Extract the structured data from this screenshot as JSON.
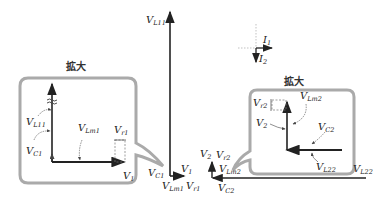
{
  "diagram": {
    "type": "phasor-diagram",
    "magnify_label": "拡大",
    "left_main": {
      "labels": {
        "VL11": {
          "base": "V",
          "sub": "L11"
        },
        "VC1": {
          "base": "V",
          "sub": "C1"
        },
        "V1": {
          "base": "V",
          "sub": "1"
        },
        "VLm1": {
          "base": "V",
          "sub": "Lm1"
        },
        "Vr1": {
          "base": "V",
          "sub": "r1"
        }
      }
    },
    "left_zoom": {
      "title": "拡大",
      "labels": {
        "VL11": {
          "base": "V",
          "sub": "L11"
        },
        "VC1": {
          "base": "V",
          "sub": "C1"
        },
        "VLm1": {
          "base": "V",
          "sub": "Lm1"
        },
        "Vr1": {
          "base": "V",
          "sub": "r1"
        },
        "V1": {
          "base": "V",
          "sub": "1"
        }
      }
    },
    "currents": {
      "I1": {
        "base": "I",
        "sub": "1"
      },
      "I2": {
        "base": "I",
        "sub": "2"
      }
    },
    "right_main": {
      "labels": {
        "V2": {
          "base": "V",
          "sub": "2"
        },
        "Vr2": {
          "base": "V",
          "sub": "r2"
        },
        "VLm2": {
          "base": "V",
          "sub": "Lm2"
        },
        "VC2": {
          "base": "V",
          "sub": "C2"
        },
        "VL22": {
          "base": "V",
          "sub": "L22"
        }
      }
    },
    "right_zoom": {
      "title": "拡大",
      "labels": {
        "Vr2": {
          "base": "V",
          "sub": "r2"
        },
        "VLm2": {
          "base": "V",
          "sub": "Lm2"
        },
        "V2": {
          "base": "V",
          "sub": "2"
        },
        "VC2": {
          "base": "V",
          "sub": "C2"
        },
        "VL22": {
          "base": "V",
          "sub": "L22"
        }
      }
    }
  }
}
